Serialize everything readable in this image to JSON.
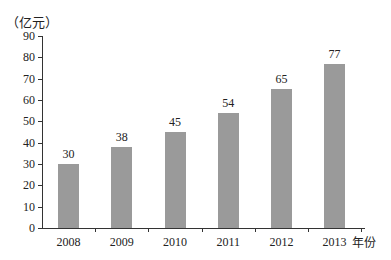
{
  "chart_data": {
    "type": "bar",
    "title": "",
    "xlabel": "年份",
    "ylabel": "（亿元）",
    "categories": [
      "2008",
      "2009",
      "2010",
      "2011",
      "2012",
      "2013"
    ],
    "values": [
      30,
      38,
      45,
      54,
      65,
      77
    ],
    "ylim": [
      0,
      90
    ],
    "yticks": [
      "0",
      "10",
      "20",
      "30",
      "40",
      "50",
      "60",
      "70",
      "80",
      "90"
    ],
    "grid": false,
    "legend": null,
    "bar_color": "#9a9a9a"
  },
  "labels": {
    "y_unit": "（亿元）",
    "x_unit": "年份"
  }
}
